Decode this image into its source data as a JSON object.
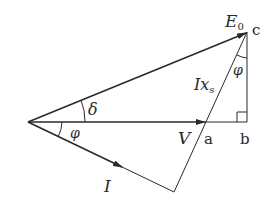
{
  "diagram": {
    "type": "phasor-diagram",
    "colors": {
      "line": "#2a2a2a",
      "background": "#ffffff"
    },
    "labels": {
      "E0": "E",
      "E0_sub": "0",
      "c": "c",
      "V": "V",
      "a": "a",
      "b": "b",
      "I": "I",
      "Ixs": "Ix",
      "Ixs_sub": "s",
      "delta": "δ",
      "phi_origin": "φ",
      "phi_c": "φ"
    }
  }
}
